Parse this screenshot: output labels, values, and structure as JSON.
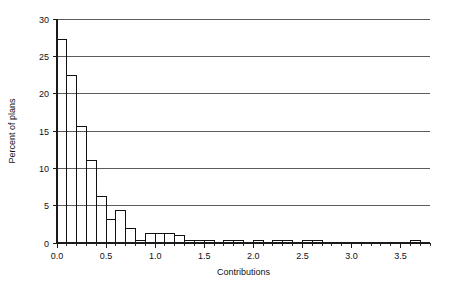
{
  "chart_data": {
    "type": "bar",
    "title": "",
    "xlabel": "Contributions",
    "ylabel": "Percent of plans",
    "xlim": [
      0.0,
      3.8
    ],
    "ylim": [
      0,
      30
    ],
    "grid": true,
    "legend": "none",
    "bin_width": 0.1,
    "xticks": [
      0.0,
      0.5,
      1.0,
      1.5,
      2.0,
      2.5,
      3.0,
      3.5
    ],
    "xticklabels": [
      "0.0",
      "0.5",
      "1.0",
      "1.5",
      "2.0",
      "2.5",
      "3.0",
      "3.5"
    ],
    "xminortick_step": 0.1,
    "yticks": [
      0,
      5,
      10,
      15,
      20,
      25,
      30
    ],
    "yticklabels": [
      "0",
      "5",
      "10",
      "15",
      "20",
      "25",
      "30"
    ],
    "gridline_values": [
      5,
      10,
      15,
      20,
      25,
      30
    ],
    "bin_edges": [
      0.0,
      0.1,
      0.2,
      0.3,
      0.4,
      0.5,
      0.6,
      0.7,
      0.8,
      0.9,
      1.0,
      1.1,
      1.2,
      1.3,
      1.4,
      1.5,
      1.6,
      1.7,
      1.8,
      1.9,
      2.0,
      2.1,
      2.2,
      2.3,
      2.4,
      2.5,
      2.6,
      2.7,
      2.8,
      2.9,
      3.0,
      3.1,
      3.2,
      3.3,
      3.4,
      3.5,
      3.6,
      3.7,
      3.8
    ],
    "x": [
      0.05,
      0.15,
      0.25,
      0.35,
      0.45,
      0.55,
      0.65,
      0.75,
      0.85,
      0.95,
      1.05,
      1.15,
      1.25,
      1.35,
      1.45,
      1.55,
      1.65,
      1.75,
      1.85,
      1.95,
      2.05,
      2.15,
      2.25,
      2.35,
      2.45,
      2.55,
      2.65,
      2.75,
      2.85,
      2.95,
      3.05,
      3.15,
      3.25,
      3.35,
      3.45,
      3.55,
      3.65,
      3.75
    ],
    "values": [
      27.2,
      22.4,
      15.6,
      11.1,
      6.2,
      3.1,
      4.3,
      2.0,
      0.3,
      1.3,
      1.3,
      1.3,
      1.0,
      0.4,
      0.4,
      0.4,
      0.1,
      0.4,
      0.4,
      0.1,
      0.4,
      0.1,
      0.4,
      0.4,
      0.1,
      0.4,
      0.4,
      0.0,
      0.0,
      0.0,
      0.0,
      0.0,
      0.0,
      0.0,
      0.0,
      0.0,
      0.4,
      0.0
    ],
    "categories": [
      "0.0-0.1",
      "0.1-0.2",
      "0.2-0.3",
      "0.3-0.4",
      "0.4-0.5",
      "0.5-0.6",
      "0.6-0.7",
      "0.7-0.8",
      "0.8-0.9",
      "0.9-1.0",
      "1.0-1.1",
      "1.1-1.2",
      "1.2-1.3",
      "1.3-1.4",
      "1.4-1.5",
      "1.5-1.6",
      "1.6-1.7",
      "1.7-1.8",
      "1.8-1.9",
      "1.9-2.0",
      "2.0-2.1",
      "2.1-2.2",
      "2.2-2.3",
      "2.3-2.4",
      "2.4-2.5",
      "2.5-2.6",
      "2.6-2.7",
      "2.7-2.8",
      "2.8-2.9",
      "2.9-3.0",
      "3.0-3.1",
      "3.1-3.2",
      "3.2-3.3",
      "3.3-3.4",
      "3.4-3.5",
      "3.5-3.6",
      "3.6-3.7",
      "3.7-3.8"
    ],
    "colors": {
      "bar_stroke": "#111111",
      "bar_fill": "none",
      "gridline": "#4a4a4a",
      "axis": "#1a1a1a",
      "background": "#ffffff",
      "text": "#111111"
    }
  }
}
